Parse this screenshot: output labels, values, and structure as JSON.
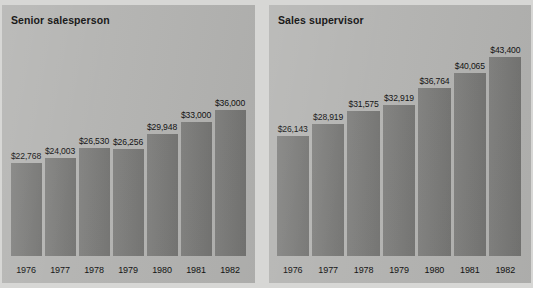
{
  "colors": {
    "page_background": "#d7d7d5",
    "panel_background": "#b4b4b2",
    "bar_fill": "#7b7b79",
    "text": "#111111"
  },
  "chart_data": [
    {
      "type": "bar",
      "title": "Senior salesperson",
      "xlabel": "",
      "ylabel": "",
      "grid": false,
      "legend": "none",
      "ylim": [
        0,
        45000
      ],
      "categories": [
        "1976",
        "1977",
        "1978",
        "1979",
        "1980",
        "1981",
        "1982"
      ],
      "values": [
        22768,
        24003,
        26530,
        26256,
        29948,
        33000,
        36000
      ],
      "data_labels": [
        "$22,768",
        "$24,003",
        "$26,530",
        "$26,256",
        "$29,948",
        "$33,000",
        "$36,000"
      ]
    },
    {
      "type": "bar",
      "title": "Sales supervisor",
      "xlabel": "",
      "ylabel": "",
      "grid": false,
      "legend": "none",
      "ylim": [
        0,
        45000
      ],
      "categories": [
        "1976",
        "1977",
        "1978",
        "1979",
        "1980",
        "1981",
        "1982"
      ],
      "values": [
        26143,
        28919,
        31575,
        32919,
        36764,
        40065,
        43400
      ],
      "data_labels": [
        "$26,143",
        "$28,919",
        "$31,575",
        "$32,919",
        "$36,764",
        "$40,065",
        "$43,400"
      ]
    }
  ]
}
